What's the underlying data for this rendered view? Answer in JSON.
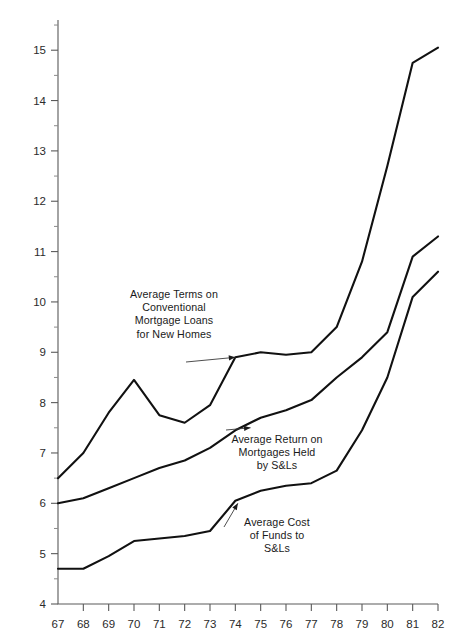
{
  "chart_data": {
    "type": "line",
    "title": "",
    "subtitle": "",
    "xlabel": "",
    "ylabel": "",
    "x": [
      67,
      68,
      69,
      70,
      71,
      72,
      73,
      74,
      75,
      76,
      77,
      78,
      79,
      80,
      81,
      82
    ],
    "x_tick_labels": [
      "67",
      "68",
      "69",
      "70",
      "71",
      "72",
      "73",
      "74",
      "75",
      "76",
      "77",
      "78",
      "79",
      "80",
      "81",
      "82"
    ],
    "y_tick_labels": [
      "4",
      "5",
      "6",
      "7",
      "8",
      "9",
      "10",
      "11",
      "12",
      "13",
      "14",
      "15"
    ],
    "y_major_ticks": [
      4,
      5,
      6,
      7,
      8,
      9,
      10,
      11,
      12,
      13,
      14,
      15
    ],
    "y_minor_ticks": [
      4.5,
      5.5,
      6.5,
      7.5,
      8.5,
      9.5,
      10.5,
      11.5,
      12.5,
      13.5,
      14.5,
      15.5
    ],
    "xlim": [
      67,
      82
    ],
    "ylim": [
      4,
      15.6
    ],
    "grid": false,
    "legend_position": "inline-annotations",
    "line_color": "#111111",
    "axis_color": "#5a5a5a",
    "series": [
      {
        "name": "Average Terms on Conventional Mortgage Loans for New Homes",
        "values": [
          6.5,
          7.0,
          7.8,
          8.45,
          7.75,
          7.6,
          7.95,
          8.9,
          9.0,
          8.95,
          9.0,
          9.5,
          10.8,
          12.7,
          14.75,
          15.05
        ]
      },
      {
        "name": "Average Return on Mortgages Held by S&Ls",
        "values": [
          6.0,
          6.1,
          6.3,
          6.5,
          6.7,
          6.85,
          7.1,
          7.45,
          7.7,
          7.85,
          8.05,
          8.5,
          8.9,
          9.4,
          10.9,
          11.3
        ]
      },
      {
        "name": "Average Cost of Funds to S&Ls",
        "values": [
          4.7,
          4.7,
          4.95,
          5.25,
          5.3,
          5.35,
          5.45,
          6.05,
          6.25,
          6.35,
          6.4,
          6.65,
          7.45,
          8.5,
          10.1,
          10.6
        ]
      }
    ],
    "annotations": [
      {
        "id": "terms",
        "text": "Average Terms on\nConventional\nMortgage Loans\nfor New Homes",
        "target_x": 74,
        "target_y": 8.9
      },
      {
        "id": "return",
        "text": "Average Return on\nMortgages Held\nby S&Ls",
        "target_x": 74.6,
        "target_y": 7.5
      },
      {
        "id": "cost",
        "text": "Average Cost\nof Funds to\nS&Ls",
        "target_x": 74.1,
        "target_y": 6.0
      }
    ]
  }
}
